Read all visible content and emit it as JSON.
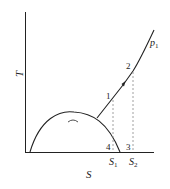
{
  "diagram": {
    "type": "T-S diagram",
    "axes": {
      "y_label": "T",
      "x_label": "S"
    },
    "curve_label": {
      "text": "p",
      "subscript": "1"
    },
    "points": [
      {
        "id": "1",
        "label": "1"
      },
      {
        "id": "2",
        "label": "2"
      },
      {
        "id": "3",
        "label": "3"
      },
      {
        "id": "4",
        "label": "4"
      }
    ],
    "entropy_marks": [
      {
        "text": "S",
        "subscript": "1"
      },
      {
        "text": "S",
        "subscript": "2"
      }
    ],
    "colors": {
      "line": "#222222",
      "dashed": "#888888",
      "background": "#ffffff"
    }
  }
}
